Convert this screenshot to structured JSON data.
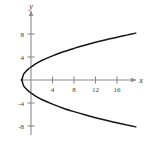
{
  "figure": {
    "title": "",
    "background_color": "#ffffff",
    "axis_color": "#8a8a8a",
    "curve_color": "#151515",
    "tick_label_color": "#3a3a3a",
    "axis_label_color": "#2b2b2b"
  },
  "axes": {
    "x_label": "x",
    "y_label": "y",
    "x_ticks": [
      "4",
      "8",
      "12",
      "16"
    ],
    "y_ticks": [
      "8",
      "4",
      "-4",
      "-8"
    ]
  },
  "chart_data": {
    "type": "line",
    "title": "",
    "xlabel": "x",
    "ylabel": "y",
    "grid": false,
    "legend": "none",
    "xlim": [
      -2,
      20
    ],
    "ylim": [
      -9.5,
      9.5
    ],
    "xticks": [
      4,
      8,
      12,
      16
    ],
    "yticks": [
      8,
      4,
      -4,
      -8
    ],
    "x_tick_labels": [
      "4",
      "8",
      "12",
      "16"
    ],
    "y_tick_labels": [
      "8",
      "4",
      "-4",
      "-8"
    ],
    "curves": [
      {
        "name": "parabola-upper-branch",
        "description": "Rightward-opening parabola, upper half",
        "equation": "y = sqrt(3.0*(x + 1.7))",
        "vertex": [
          -1.7,
          0
        ],
        "points": [
          [
            -1.7,
            0.0
          ],
          [
            -1.4,
            0.95
          ],
          [
            -1.0,
            1.45
          ],
          [
            -0.5,
            1.9
          ],
          [
            0.0,
            2.26
          ],
          [
            1.0,
            2.9
          ],
          [
            2.0,
            3.4
          ],
          [
            4.0,
            4.2
          ],
          [
            6.0,
            4.9
          ],
          [
            8.0,
            5.5
          ],
          [
            10.0,
            6.05
          ],
          [
            12.0,
            6.55
          ],
          [
            14.0,
            7.0
          ],
          [
            16.0,
            7.45
          ],
          [
            18.0,
            7.85
          ],
          [
            19.5,
            8.15
          ]
        ]
      },
      {
        "name": "parabola-lower-branch",
        "description": "Rightward-opening parabola, lower half",
        "equation": "y = -sqrt(3.0*(x + 1.7))",
        "vertex": [
          -1.7,
          0
        ],
        "points": [
          [
            -1.7,
            0.0
          ],
          [
            -1.4,
            -0.95
          ],
          [
            -1.0,
            -1.45
          ],
          [
            -0.5,
            -1.9
          ],
          [
            0.0,
            -2.26
          ],
          [
            1.0,
            -2.9
          ],
          [
            2.0,
            -3.4
          ],
          [
            4.0,
            -4.2
          ],
          [
            6.0,
            -4.9
          ],
          [
            8.0,
            -5.5
          ],
          [
            10.0,
            -6.05
          ],
          [
            12.0,
            -6.55
          ],
          [
            14.0,
            -7.0
          ],
          [
            16.0,
            -7.45
          ],
          [
            18.0,
            -7.85
          ],
          [
            19.5,
            -8.15
          ]
        ]
      }
    ]
  }
}
